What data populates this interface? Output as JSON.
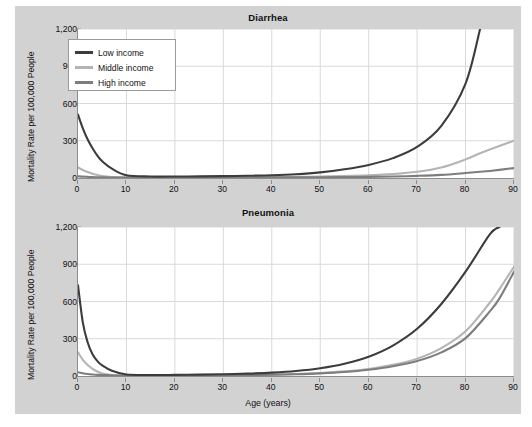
{
  "figure": {
    "background_color": "#d2d2d2",
    "plot_background_color": "#ffffff",
    "axis_color": "#8d8d8d",
    "grid_color": "#d9d9d9"
  },
  "legend": {
    "position": "top-left-inside-upper-panel",
    "entries": [
      {
        "label": "Low income",
        "color": "#3c3c3c"
      },
      {
        "label": "Middle income",
        "color": "#b4b4b4"
      },
      {
        "label": "High income",
        "color": "#7d7d7d"
      }
    ]
  },
  "chart_data": [
    {
      "type": "line",
      "title": "Diarrhea",
      "xlabel": "",
      "ylabel": "Mortality Rate per 100,000 People",
      "xlim": [
        0,
        90
      ],
      "ylim": [
        0,
        1200
      ],
      "xticks": [
        0,
        10,
        20,
        30,
        40,
        50,
        60,
        70,
        80,
        90
      ],
      "xticklabels": [
        "0",
        "10",
        "20",
        "30",
        "40",
        "50",
        "60",
        "70",
        "80",
        "90"
      ],
      "yticks": [
        0,
        300,
        600,
        900,
        1200
      ],
      "yticklabels": [
        "0",
        "300",
        "600",
        "900",
        "1,200"
      ],
      "grid": true,
      "legend_position": "upper left",
      "x": [
        0,
        1,
        2,
        3,
        4,
        5,
        7,
        10,
        15,
        20,
        25,
        30,
        35,
        40,
        45,
        50,
        55,
        60,
        65,
        70,
        75,
        80,
        83,
        85,
        90
      ],
      "series": [
        {
          "name": "Low income",
          "color": "#3c3c3c",
          "values": [
            510,
            400,
            310,
            240,
            180,
            135,
            75,
            22,
            12,
            12,
            13,
            15,
            18,
            22,
            30,
            45,
            70,
            105,
            160,
            250,
            420,
            760,
            1200,
            null,
            null
          ]
        },
        {
          "name": "Middle income",
          "color": "#b4b4b4",
          "values": [
            85,
            64,
            48,
            35,
            24,
            15,
            7,
            3,
            3,
            3,
            4,
            5,
            6,
            7,
            9,
            12,
            16,
            22,
            32,
            50,
            85,
            150,
            200,
            230,
            300
          ]
        },
        {
          "name": "High income",
          "color": "#7d7d7d",
          "values": [
            14,
            11,
            9,
            7,
            6,
            5,
            4,
            3,
            3,
            3,
            3,
            4,
            4,
            5,
            5,
            6,
            7,
            9,
            12,
            17,
            25,
            40,
            50,
            57,
            80
          ]
        }
      ]
    },
    {
      "type": "line",
      "title": "Pneumonia",
      "xlabel": "Age (years)",
      "ylabel": "Mortality Rate per 100,000 People",
      "xlim": [
        0,
        90
      ],
      "ylim": [
        0,
        1200
      ],
      "xticks": [
        0,
        10,
        20,
        30,
        40,
        50,
        60,
        70,
        80,
        90
      ],
      "xticklabels": [
        "0",
        "10",
        "20",
        "30",
        "40",
        "50",
        "60",
        "70",
        "80",
        "90"
      ],
      "yticks": [
        0,
        300,
        600,
        900,
        1200
      ],
      "yticklabels": [
        "0",
        "300",
        "600",
        "900",
        "1,200"
      ],
      "grid": true,
      "x": [
        0,
        1,
        2,
        3,
        4,
        5,
        7,
        10,
        15,
        20,
        25,
        30,
        35,
        40,
        45,
        50,
        55,
        60,
        65,
        70,
        75,
        80,
        85,
        87,
        90
      ],
      "series": [
        {
          "name": "Low income",
          "color": "#3c3c3c",
          "values": [
            730,
            430,
            270,
            175,
            120,
            85,
            42,
            12,
            8,
            9,
            11,
            14,
            19,
            27,
            40,
            62,
            98,
            155,
            245,
            380,
            580,
            840,
            1140,
            1200,
            null
          ]
        },
        {
          "name": "Middle income",
          "color": "#b4b4b4",
          "values": [
            190,
            130,
            88,
            58,
            36,
            20,
            8,
            3,
            3,
            4,
            5,
            6,
            8,
            11,
            16,
            24,
            37,
            57,
            90,
            140,
            225,
            360,
            590,
            700,
            880
          ]
        },
        {
          "name": "High income",
          "color": "#7d7d7d",
          "values": [
            30,
            22,
            16,
            12,
            9,
            7,
            5,
            3,
            3,
            3,
            4,
            5,
            7,
            10,
            14,
            21,
            32,
            50,
            78,
            120,
            190,
            305,
            520,
            625,
            840
          ]
        }
      ]
    }
  ]
}
